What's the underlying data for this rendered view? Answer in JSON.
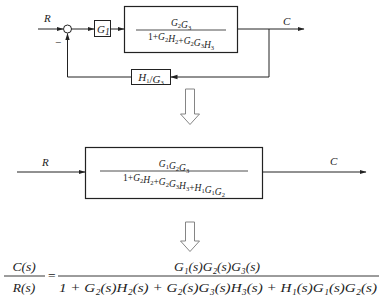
{
  "diagram_top": {
    "input_label": "R",
    "output_label": "C",
    "minus_sign": "−",
    "g1_block": {
      "text": "G",
      "sub": "1"
    },
    "main_block": {
      "numerator": [
        {
          "t": "G",
          "s": "2"
        },
        {
          "t": "G",
          "s": "3"
        }
      ],
      "denominator_parts": [
        {
          "t": "1+"
        },
        {
          "t": "G",
          "s": "2"
        },
        {
          "t": "H",
          "s": "2"
        },
        {
          "t": "+"
        },
        {
          "t": "G",
          "s": "2"
        },
        {
          "t": "G",
          "s": "3"
        },
        {
          "t": "H",
          "s": "3"
        }
      ]
    },
    "feedback_block": {
      "parts": [
        {
          "t": "H",
          "s": "1"
        },
        {
          "t": "/"
        },
        {
          "t": "G",
          "s": "3"
        }
      ]
    }
  },
  "transform_arrow_1": "down-hollow-arrow",
  "diagram_middle": {
    "input_label": "R",
    "output_label": "C",
    "main_block": {
      "numerator": [
        {
          "t": "G",
          "s": "1"
        },
        {
          "t": "G",
          "s": "2"
        },
        {
          "t": "G",
          "s": "3"
        }
      ],
      "denominator_parts": [
        {
          "t": "1+"
        },
        {
          "t": "G",
          "s": "2"
        },
        {
          "t": "H",
          "s": "2"
        },
        {
          "t": "+"
        },
        {
          "t": "G",
          "s": "2"
        },
        {
          "t": "G",
          "s": "3"
        },
        {
          "t": "H",
          "s": "3"
        },
        {
          "t": "+"
        },
        {
          "t": "H",
          "s": "1"
        },
        {
          "t": "G",
          "s": "1"
        },
        {
          "t": "G",
          "s": "2"
        }
      ]
    }
  },
  "transform_arrow_2": "down-hollow-arrow",
  "formula": {
    "lhs_num": "C(s)",
    "lhs_den": "R(s)",
    "equals": "=",
    "rhs_num": "G₁(s)G₂(s)G₃(s)",
    "rhs_den": "1 + G₂(s)H₂(s) + G₂(s)G₃(s)H₃(s) + H₁(s)G₁(s)G₂(s)"
  }
}
